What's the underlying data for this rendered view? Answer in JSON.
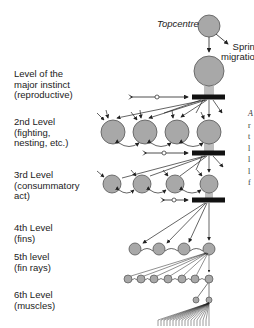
{
  "diagram": {
    "title": "Topcentre",
    "side_note": "Spring\nmigration",
    "levels": [
      {
        "id": "major",
        "label": "Level of the\nmajor instinct\n(reproductive)"
      },
      {
        "id": "level2",
        "label": "2nd Level\n(fighting,\nnesting, etc.)"
      },
      {
        "id": "level3",
        "label": "3rd Level\n(consummatory\nact)"
      },
      {
        "id": "level4",
        "label": "4th Level\n(fins)"
      },
      {
        "id": "level5",
        "label": "5th level\n(fin rays)"
      },
      {
        "id": "level6",
        "label": "6th Level\n(muscles)"
      }
    ],
    "colors": {
      "node_fill": "#a8a8a8",
      "node_stroke": "#555555",
      "line": "#222222",
      "block": "#111111"
    },
    "right_edge_fragments": [
      "A",
      "r",
      "t",
      "l",
      "l",
      "l",
      "f"
    ]
  }
}
